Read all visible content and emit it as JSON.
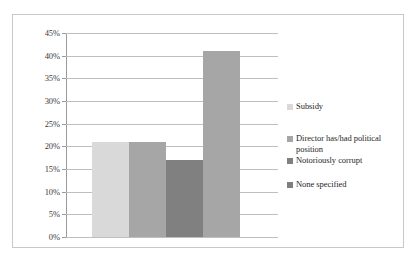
{
  "chart_data": {
    "type": "bar",
    "title": "",
    "subtitle": "",
    "xlabel": "",
    "ylabel": "",
    "categories": [
      "Subsidy",
      "Director has/had political position",
      "Notoriously corrupt",
      "None specified"
    ],
    "values": [
      21,
      21,
      17,
      41
    ],
    "value_labels": [
      "21%",
      "21%",
      "17%",
      "41%"
    ],
    "ylim": [
      0,
      45
    ],
    "y_ticks": [
      0,
      5,
      10,
      15,
      20,
      25,
      30,
      35,
      40,
      45
    ],
    "y_tick_labels": [
      "0%",
      "5%",
      "10%",
      "15%",
      "20%",
      "25%",
      "30%",
      "35%",
      "40%",
      "45%"
    ],
    "x_tick_labels": [],
    "grid": true,
    "grid_axis": "y",
    "legend_position": "right",
    "series_colors": [
      "#d9d9d9",
      "#a6a6a6",
      "#808080",
      "#a6a6a6"
    ]
  },
  "legend": {
    "items": [
      {
        "label": "Subsidy",
        "color": "#d9d9d9"
      },
      {
        "label": "Director has/had political position",
        "color": "#a6a6a6"
      },
      {
        "label": "Notoriously corrupt",
        "color": "#808080"
      },
      {
        "label": "None specified",
        "color": "#7f7f7f"
      }
    ]
  },
  "style": {
    "border_color": "#c8c8c8",
    "gridline_color": "#bfbfbf",
    "axis_color": "#9a9a9a",
    "text_color": "#1f1f1f",
    "background": "#ffffff"
  }
}
